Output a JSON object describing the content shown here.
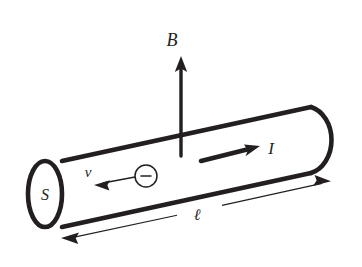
{
  "figure": {
    "background_color": "#ffffff",
    "ink_color": "#231f20"
  },
  "labels": {
    "magnetic_field": "B",
    "current": "I",
    "cross_section": "S",
    "drift_velocity": "v",
    "length": "ℓ",
    "charge_sign": "−"
  },
  "elements": {
    "conductor_name": "cylindrical conductor",
    "field_arrow_name": "magnetic field arrow",
    "current_arrow_name": "current direction arrow",
    "velocity_arrow_name": "drift velocity arrow",
    "charge_name": "negative charge carrier",
    "dimension_name": "length dimension line"
  },
  "geometry": {
    "cylinder_left_center": [
      45,
      194
    ],
    "cylinder_left_rx": 17,
    "cylinder_left_ry": 33,
    "top_edge": [
      [
        62,
        161
      ],
      [
        311,
        107
      ]
    ],
    "bottom_edge": [
      [
        62,
        227
      ],
      [
        311,
        173
      ]
    ],
    "right_cap": [
      [
        311,
        107
      ],
      [
        311,
        173
      ]
    ],
    "field_arrow": [
      [
        181,
        156
      ],
      [
        181,
        58
      ]
    ],
    "current_arrow": [
      [
        201,
        160
      ],
      [
        258,
        146
      ]
    ],
    "velocity_arrow": [
      [
        135,
        176
      ],
      [
        96,
        184
      ]
    ],
    "charge_circle": [
      146,
      176,
      11
    ],
    "dimension_left_tip": [
      62,
      238
    ],
    "dimension_right_tip": [
      330,
      178
    ]
  }
}
